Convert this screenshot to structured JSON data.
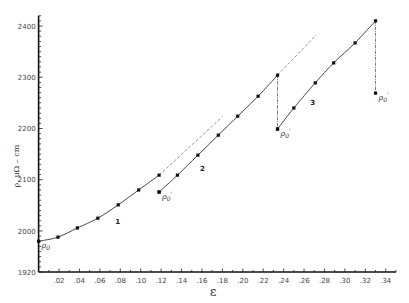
{
  "chart_data": {
    "type": "line",
    "title": "",
    "xlabel": "ε",
    "ylabel": "ρ, μΩ – cm",
    "xlim": [
      0,
      0.35
    ],
    "ylim": [
      1920,
      2420
    ],
    "x_ticks": [
      0.02,
      0.04,
      0.06,
      0.08,
      0.1,
      0.12,
      0.14,
      0.16,
      0.18,
      0.2,
      0.22,
      0.24,
      0.26,
      0.28,
      0.3,
      0.32,
      0.34
    ],
    "x_tick_labels": [
      ".02",
      ".04",
      ".06",
      ".08",
      ".10",
      ".12",
      ".14",
      ".16",
      ".18",
      ".20",
      ".22",
      ".24",
      ".26",
      ".28",
      ".30",
      ".32",
      ".34"
    ],
    "y_ticks": [
      1920,
      2000,
      2100,
      2200,
      2300,
      2400
    ],
    "y_tick_labels": [
      "1920",
      "2000",
      "2100",
      "2200",
      "2300",
      "2400"
    ],
    "grid": false,
    "series": [
      {
        "name": "1",
        "x": [
          0.0,
          0.019,
          0.038,
          0.058,
          0.078,
          0.098,
          0.118
        ],
        "y": [
          1980,
          1988,
          2006,
          2025,
          2051,
          2080,
          2109
        ]
      },
      {
        "name": "2",
        "x": [
          0.118,
          0.136,
          0.156,
          0.176,
          0.195,
          0.215,
          0.234
        ],
        "y": [
          2076,
          2109,
          2148,
          2187,
          2224,
          2263,
          2304
        ]
      },
      {
        "name": "3",
        "x": [
          0.234,
          0.25,
          0.271,
          0.289,
          0.31,
          0.33
        ],
        "y": [
          2199,
          2240,
          2289,
          2328,
          2367,
          2410
        ]
      }
    ],
    "annotations": [
      {
        "text": "ρ0",
        "x": 0.0,
        "y": 1980
      },
      {
        "text": "ρ0'",
        "x": 0.118,
        "y": 2076
      },
      {
        "text": "ρ0'",
        "x": 0.234,
        "y": 2199
      },
      {
        "text": "ρ0'",
        "x": 0.33,
        "y": 2269
      }
    ],
    "dashed_extrapolations": [
      {
        "from": [
          0.118,
          2109
        ],
        "to": [
          0.18,
          2223
        ]
      },
      {
        "from": [
          0.234,
          2304
        ],
        "to": [
          0.272,
          2383
        ]
      }
    ],
    "dash_dot_drops": [
      {
        "x": 0.234,
        "from": 2304,
        "to": 2199
      },
      {
        "x": 0.33,
        "from": 2410,
        "to": 2269
      }
    ],
    "legend": "none; curves labeled 1, 2, 3 inline"
  }
}
